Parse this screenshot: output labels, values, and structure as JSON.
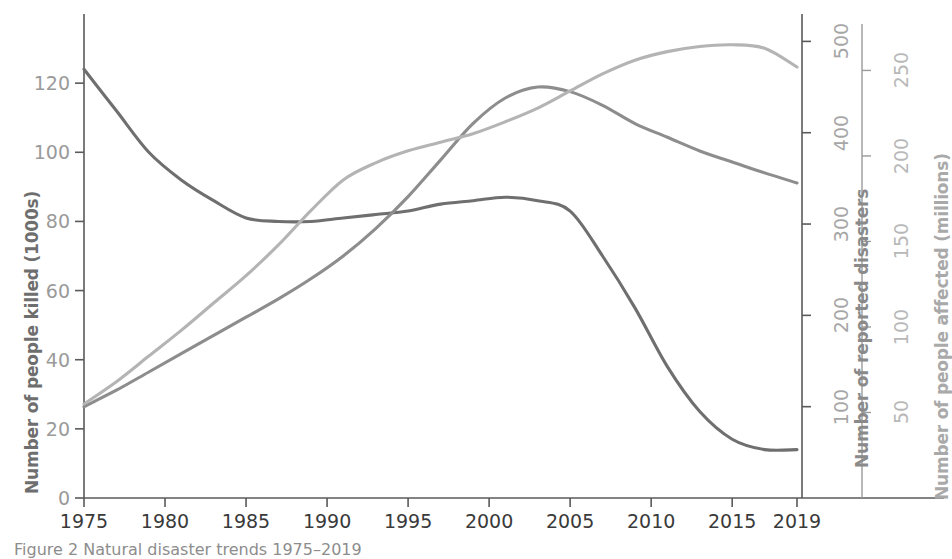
{
  "caption": "Figure 2 Natural disaster trends 1975–2019",
  "colors": {
    "killed": "#6f6f6f",
    "disasters": "#8d8d8d",
    "affected": "#b4b4b4",
    "axis": "#5a5a5a",
    "tick_text": "#9a9a9a",
    "xtick_text": "#3a3a3a"
  },
  "axes": {
    "x": {
      "label": "",
      "ticks": [
        "1975",
        "1980",
        "1985",
        "1990",
        "1995",
        "2000",
        "2005",
        "2010",
        "2015",
        "2019"
      ],
      "tick_values": [
        1975,
        1980,
        1985,
        1990,
        1995,
        2000,
        2005,
        2010,
        2015,
        2019
      ],
      "range": [
        1975,
        2019
      ]
    },
    "y_left": {
      "label": "Number of people killed (1000s)",
      "ticks": [
        "0",
        "20",
        "40",
        "60",
        "80",
        "100",
        "120"
      ],
      "tick_values": [
        0,
        20,
        40,
        60,
        80,
        100,
        120
      ],
      "range": [
        0,
        140
      ]
    },
    "y_right_1": {
      "label": "Number of reported disasters",
      "ticks": [
        "100",
        "200",
        "300",
        "400",
        "500"
      ],
      "tick_values": [
        100,
        200,
        300,
        400,
        500
      ],
      "range": [
        0,
        530
      ]
    },
    "y_right_2": {
      "label": "Number of people affected (millions)",
      "ticks": [
        "50",
        "100",
        "150",
        "200",
        "250"
      ],
      "tick_values": [
        50,
        100,
        150,
        200,
        250
      ],
      "range": [
        0,
        283
      ]
    }
  },
  "chart_data": {
    "type": "line",
    "title": "",
    "xlabel": "",
    "grid": false,
    "legend": "none",
    "x": [
      1975,
      1977,
      1979,
      1981,
      1983,
      1985,
      1987,
      1989,
      1991,
      1993,
      1995,
      1997,
      1999,
      2001,
      2003,
      2005,
      2007,
      2009,
      2011,
      2013,
      2015,
      2017,
      2019
    ],
    "series": [
      {
        "name": "Number of people killed (1000s)",
        "axis": "y_left",
        "ylabel": "Number of people killed (1000s)",
        "unit": "thousands",
        "color": "#6f6f6f",
        "values": [
          124,
          112,
          100,
          92,
          86,
          81,
          80,
          80,
          81,
          82,
          83,
          85,
          86,
          87,
          86,
          83,
          70,
          55,
          38,
          25,
          17,
          14,
          14
        ]
      },
      {
        "name": "Number of reported disasters",
        "axis": "y_right_1",
        "ylabel": "Number of reported disasters",
        "unit": "count",
        "color": "#8d8d8d",
        "values": [
          100,
          118,
          138,
          158,
          178,
          198,
          218,
          240,
          265,
          295,
          330,
          370,
          410,
          438,
          450,
          445,
          430,
          410,
          395,
          380,
          368,
          356,
          345
        ]
      },
      {
        "name": "Number of people affected (millions)",
        "axis": "y_right_2",
        "ylabel": "Number of people affected (millions)",
        "unit": "millions",
        "color": "#b4b4b4",
        "values": [
          55,
          68,
          83,
          98,
          114,
          130,
          148,
          168,
          186,
          196,
          203,
          208,
          213,
          220,
          228,
          238,
          248,
          256,
          261,
          264,
          265,
          263,
          252
        ]
      }
    ]
  }
}
